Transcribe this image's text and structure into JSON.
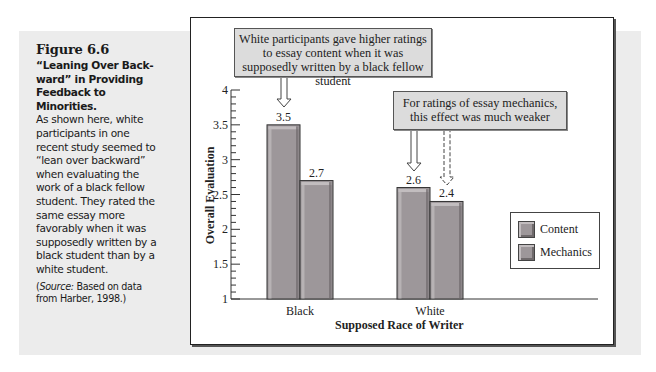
{
  "caption": {
    "figure_label": "Figure 6.6",
    "heading": "“Leaning Over Back-ward” in Providing Feedback to Minorities.",
    "body": "As shown here, white participants in one recent study seemed to “lean over backward” when evaluating the work of a black fellow student. They rated the same essay more favorably when it was supposedly written by a black student than by a white student.",
    "source_prefix": "(",
    "source_italic": "Source:",
    "source_rest": " Based on data from Harber, 1998.)"
  },
  "callouts": {
    "content": "White participants gave higher ratings to essay content when it was supposedly written by a black fellow student",
    "mechanics": "For ratings of essay mechanics, this effect was much weaker"
  },
  "chart_data": {
    "type": "bar",
    "title": "",
    "xlabel": "Supposed Race of Writer",
    "ylabel": "Overall Evaluation",
    "categories": [
      "Black",
      "White"
    ],
    "series": [
      {
        "name": "Content",
        "values": [
          3.5,
          2.6
        ]
      },
      {
        "name": "Mechanics",
        "values": [
          2.7,
          2.4
        ]
      }
    ],
    "ylim": [
      1,
      4
    ],
    "yticks": [
      "1",
      "1.5",
      "2",
      "2.5",
      "3",
      "3.5",
      "4"
    ],
    "minor_tick_step": 0.1,
    "grid": false,
    "legend_position": "right",
    "data_labels": [
      "3.5",
      "2.7",
      "2.6",
      "2.4"
    ],
    "annotations": [
      "White participants gave higher ratings to essay content when it was supposedly written by a black fellow student",
      "For ratings of essay mechanics, this effect was much weaker"
    ]
  },
  "legend": {
    "items": [
      {
        "label": "Content"
      },
      {
        "label": "Mechanics"
      }
    ]
  },
  "colors": {
    "bar_fill": "#9d979a",
    "bar_highlight": "#c2bdbf",
    "bar_shadow": "#6f6a6c",
    "panel_bg": "#ececec",
    "callout_bg": "#dcdcdc"
  }
}
